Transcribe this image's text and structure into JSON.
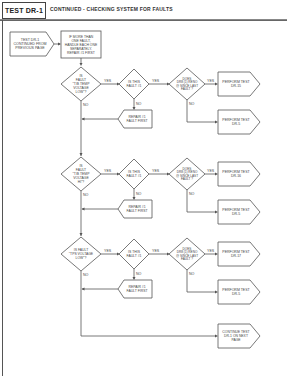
{
  "header": {
    "tab_label": "TEST DR-1",
    "title": "CONTINUED - CHECKING SYSTEM FOR FAULTS"
  },
  "flowchart": {
    "start": {
      "lines": [
        "TEST DR-1",
        "CONTINUED FROM",
        "PREVIOUS PAGE"
      ]
    },
    "intro_box": {
      "lines": [
        "IF MORE THAN",
        "ONE FAULT,",
        "HANDLE EACH ONE",
        "SEPARATELY.",
        "REPAIR #1 FIRST"
      ]
    },
    "labels": {
      "yes": "YES",
      "no": "NO"
    },
    "rows": [
      {
        "question": [
          "IS",
          "FAULT",
          "\"T/B TEMP",
          "VOLTAGE",
          "LOW\"?"
        ],
        "is_fault": [
          "IS THIS",
          "FAULT #1"
        ],
        "does_reoccur": [
          "DOES",
          "DR8 (1) RENO",
          "@ SINCE LAST",
          "FAULT ?"
        ],
        "repair": [
          "REPAIR #1",
          "FAULT FIRST"
        ],
        "yes_action": [
          "PERFORM TEST",
          "DR-15"
        ],
        "no_action": [
          "PERFORM TEST",
          "DR-5"
        ]
      },
      {
        "question": [
          "IS",
          "FAULT",
          "\"T/B TEMP",
          "VOLTAGE",
          "HI\"?"
        ],
        "is_fault": [
          "IS THIS",
          "FAULT #1"
        ],
        "does_reoccur": [
          "DOES",
          "DR8 (1) RENO",
          "@ SINCE LAST",
          "FAULT ?"
        ],
        "repair": [
          "REPAIR #1",
          "FAULT FIRST"
        ],
        "yes_action": [
          "PERFORM TEST",
          "DR-16"
        ],
        "no_action": [
          "PERFORM TEST",
          "DR-5"
        ]
      },
      {
        "question": [
          "IS FAULT",
          "\"TPS VOLTAGE",
          "LOW\"?"
        ],
        "is_fault": [
          "IS THIS",
          "FAULT #1"
        ],
        "does_reoccur": [
          "DOES",
          "DR8 (1) RENO",
          "@ SINCE LAST",
          "FAULT ?"
        ],
        "repair": [
          "REPAIR #1",
          "FAULT FIRST"
        ],
        "yes_action": [
          "PERFORM TEST",
          "DR-17"
        ],
        "no_action": [
          "PERFORM TEST",
          "DR-5"
        ]
      }
    ],
    "continue": {
      "lines": [
        "CONTINUE TEST",
        "DR-1 ON NEXT",
        "PAGE"
      ]
    }
  }
}
